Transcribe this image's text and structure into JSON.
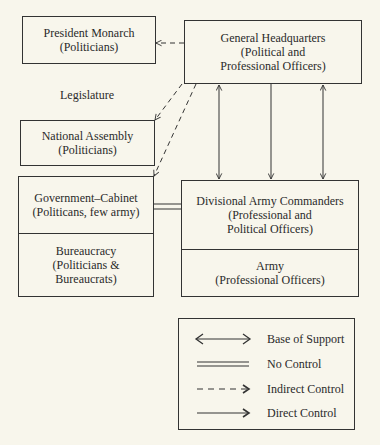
{
  "diagram": {
    "colors": {
      "background": "#f8f6ec",
      "line": "#333333",
      "text": "#2a2a2a"
    },
    "nodes": {
      "president": {
        "title": "President Monarch",
        "subtitle": "(Politicians)"
      },
      "legislature": {
        "label": "Legislature"
      },
      "national_assembly": {
        "title": "National Assembly",
        "subtitle": "(Politicians)"
      },
      "general_hq": {
        "title": "General Headquarters",
        "line2": "(Political and",
        "line3": "Professional Officers)"
      },
      "government_cabinet": {
        "title": "Government–Cabinet",
        "subtitle": "(Politicans, few army)"
      },
      "bureaucracy": {
        "title": "Bureaucracy",
        "line2": "(Politicians &",
        "line3": "Bureaucrats)"
      },
      "divisional_army": {
        "title": "Divisional Army Commanders",
        "line2": "(Professional and",
        "line3": "Political Officers)"
      },
      "army": {
        "title": "Army",
        "subtitle": "(Professional Officers)"
      }
    },
    "edges": [
      {
        "from": "general_hq",
        "to": "president",
        "type": "Indirect Control"
      },
      {
        "from": "general_hq",
        "to": "national_assembly",
        "type": "Indirect Control"
      },
      {
        "from": "general_hq",
        "to": "government_cabinet",
        "type": "Indirect Control"
      },
      {
        "from": "general_hq",
        "to": "divisional_army",
        "type": "Base of Support"
      },
      {
        "from": "general_hq",
        "to": "divisional_army",
        "type": "Direct Control"
      },
      {
        "from": "general_hq",
        "to": "divisional_army",
        "type": "Base of Support"
      },
      {
        "from": "government_cabinet",
        "to": "divisional_army",
        "type": "No Control"
      }
    ],
    "legend": {
      "items": [
        {
          "symbol": "double-headed-arrow",
          "label": "Base of Support"
        },
        {
          "symbol": "double-line",
          "label": "No Control"
        },
        {
          "symbol": "dashed-arrow",
          "label": "Indirect Control"
        },
        {
          "symbol": "solid-arrow",
          "label": "Direct Control"
        }
      ]
    }
  }
}
